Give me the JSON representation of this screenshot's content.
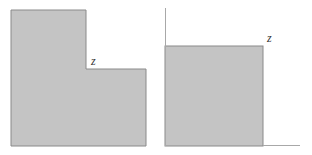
{
  "colors": {
    "fill": "#c4c4c4",
    "stroke": "#8a8a8a",
    "axis": "#a8a8a8",
    "text": "#333333"
  },
  "left_figure": {
    "shape": "L-shaped region",
    "label": "z"
  },
  "right_figure": {
    "shape": "square region with axes",
    "label": "z"
  }
}
